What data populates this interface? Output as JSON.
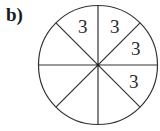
{
  "label": "b)",
  "diagram": {
    "type": "circle-divided-into-equal-sectors",
    "sectors": 8,
    "center": [
      98,
      65
    ],
    "radius": 60,
    "labels": [
      {
        "sector": "top-left-upper",
        "text": "3"
      },
      {
        "sector": "top-right-upper",
        "text": "3"
      },
      {
        "sector": "right-upper",
        "text": "3"
      },
      {
        "sector": "right-lower",
        "text": "3"
      }
    ],
    "stroke_color": "#333333"
  }
}
